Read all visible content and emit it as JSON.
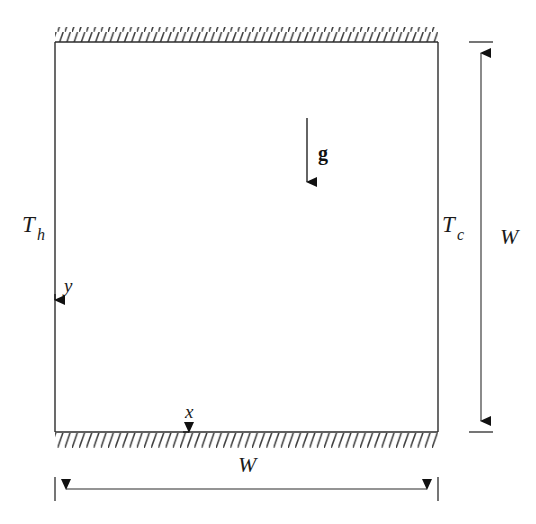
{
  "figure": {
    "background_color": "#ffffff",
    "line_color": "#2b2b2b",
    "hatch_color": "#3a3a3a",
    "text_color": "#1a1a1a"
  },
  "cavity": {
    "name": "square-cavity",
    "left": 55,
    "top": 42,
    "right": 438,
    "bottom": 432
  },
  "walls": {
    "top": {
      "name": "top-adiabatic-wall",
      "hatch_direction": "up-right",
      "hatch_side": "above"
    },
    "bottom": {
      "name": "bottom-adiabatic-wall",
      "hatch_direction": "up-right",
      "hatch_side": "below"
    }
  },
  "labels": {
    "hot_wall": {
      "base": "T",
      "sub": "h"
    },
    "cold_wall": {
      "base": "T",
      "sub": "c"
    },
    "gravity": "g",
    "axis_x": "x",
    "axis_y": "y",
    "width_bottom": "W",
    "width_right": "W"
  },
  "axes": {
    "x_axis": {
      "name": "x-axis-arrow",
      "direction": "right",
      "origin_x": 55,
      "origin_y": 432,
      "tip_x": 200
    },
    "y_axis": {
      "name": "y-axis-arrow",
      "direction": "up",
      "origin_x": 55,
      "origin_y": 432,
      "tip_y": 283
    }
  },
  "gravity_vector": {
    "name": "gravity-arrow",
    "direction": "down",
    "x": 307,
    "y_start": 118,
    "y_end": 193
  },
  "dimensions": {
    "horizontal": {
      "name": "width-dimension-horizontal",
      "label": "W",
      "x_start": 55,
      "x_end": 438,
      "y": 489,
      "arrowheads": "both"
    },
    "vertical": {
      "name": "width-dimension-vertical",
      "label": "W",
      "x": 481,
      "y_start": 42,
      "y_end": 432,
      "arrowheads": "both"
    }
  }
}
